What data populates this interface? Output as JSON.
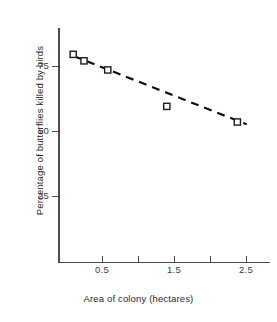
{
  "chart_data": {
    "type": "scatter",
    "title": "",
    "xlabel": "Area of colony (hectares)",
    "ylabel": "Percentage of butterflies killed by birds",
    "xlim": [
      0,
      2.95
    ],
    "ylim": [
      0,
      90
    ],
    "grid": false,
    "legend": null,
    "x_ticks": [
      {
        "value": 0.5,
        "label": "0.5",
        "labelled": true
      },
      {
        "value": 1.0,
        "label": "",
        "labelled": false
      },
      {
        "value": 1.5,
        "label": "1.5",
        "labelled": true
      },
      {
        "value": 2.0,
        "label": "",
        "labelled": false
      },
      {
        "value": 2.5,
        "label": "2.5",
        "labelled": true
      }
    ],
    "y_ticks": [
      {
        "value": 25,
        "label": "25"
      },
      {
        "value": 50,
        "label": "50"
      },
      {
        "value": 75,
        "label": "75"
      }
    ],
    "series": [
      {
        "name": "Colonies",
        "marker": "open-square",
        "x": [
          0.1,
          0.25,
          0.58,
          1.4,
          2.38
        ],
        "y": [
          79.5,
          77.0,
          73.5,
          59.5,
          53.5
        ],
        "points": [
          {
            "area": 0.1,
            "percent": 79.5
          },
          {
            "area": 0.25,
            "percent": 77.0
          },
          {
            "area": 0.58,
            "percent": 73.5
          },
          {
            "area": 1.4,
            "percent": 59.5
          },
          {
            "area": 2.38,
            "percent": 53.5
          }
        ]
      },
      {
        "name": "Line of best fit",
        "type": "line",
        "style": "dashed",
        "x": [
          0.11,
          2.51
        ],
        "y": [
          78.8,
          52.6
        ]
      }
    ],
    "colors": {
      "marker_stroke": "#1c1c1c",
      "marker_fill": "#ffffff",
      "trend_line": "#111111",
      "axis": "#4a4a4a",
      "background": "#ffffff"
    }
  },
  "axes": {
    "x_title": "Area of colony (hectares)",
    "y_title": "Percentage of butterflies killed by birds",
    "x_tick_labels": [
      "0.5",
      "1.5",
      "2.5"
    ],
    "y_tick_labels": [
      "75",
      "50",
      "25"
    ]
  }
}
